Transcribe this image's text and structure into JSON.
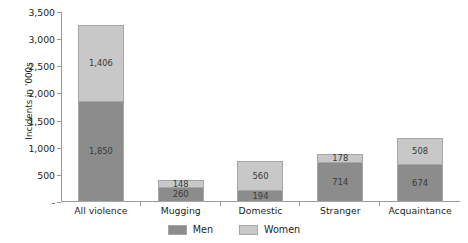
{
  "chart_data": {
    "type": "bar",
    "subtype": "stacked-vertical",
    "title": "",
    "xlabel": "",
    "ylabel": "Incidents in '000s",
    "ylim": [
      0,
      3500
    ],
    "ytick_values": [
      0,
      500,
      1000,
      1500,
      2000,
      2500,
      3000,
      3500
    ],
    "ytick_labels": [
      "-",
      "500",
      "1,000",
      "1,500",
      "2,000",
      "2,500",
      "3,000",
      "3,500"
    ],
    "grid": false,
    "legend_position": "bottom-center",
    "categories": [
      "All violence",
      "Mugging",
      "Domestic",
      "Stranger",
      "Acquaintance"
    ],
    "series": [
      {
        "name": "Men",
        "color": "#8c8c8c",
        "values": [
          1850,
          260,
          194,
          714,
          674
        ],
        "labels": [
          "1,850",
          "260",
          "194",
          "714",
          "674"
        ]
      },
      {
        "name": "Women",
        "color": "#c8c8c8",
        "values": [
          1406,
          148,
          560,
          178,
          508
        ],
        "labels": [
          "1,406",
          "148",
          "560",
          "178",
          "508"
        ]
      }
    ],
    "totals": [
      3256,
      408,
      754,
      892,
      1182
    ]
  },
  "legend": {
    "items": [
      {
        "label": "Men",
        "color": "#8c8c8c"
      },
      {
        "label": "Women",
        "color": "#c8c8c8"
      }
    ]
  }
}
